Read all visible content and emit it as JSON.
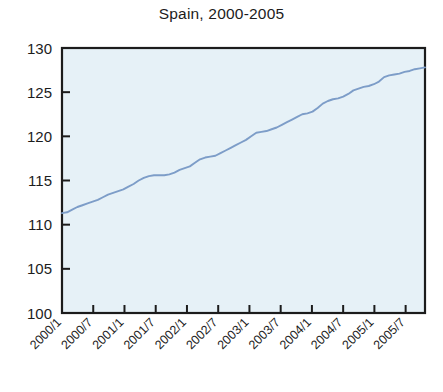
{
  "chart_data": {
    "type": "line",
    "title": "Spain, 2000-2005",
    "xlabel": "",
    "ylabel": "",
    "ylim": [
      100,
      130
    ],
    "yticks": [
      100,
      105,
      110,
      115,
      120,
      125,
      130
    ],
    "ytick_labels": [
      "100",
      "105",
      "110",
      "115",
      "120",
      "125",
      "130"
    ],
    "xtick_labels": [
      "2000/1",
      "2000/7",
      "2001/1",
      "2001/7",
      "2002/1",
      "2002/7",
      "2003/1",
      "2003/7",
      "2004/1",
      "2004/7",
      "2005/1",
      "2005/7"
    ],
    "xtick_label_rotation": -45,
    "grid": false,
    "legend": null,
    "plot_background_color": "#e6f1f7",
    "line_color": "#7d9dc8",
    "frame_color": "#1c1c1c",
    "x": [
      "2000/1",
      "2000/2",
      "2000/3",
      "2000/4",
      "2000/5",
      "2000/6",
      "2000/7",
      "2000/8",
      "2000/9",
      "2000/10",
      "2000/11",
      "2000/12",
      "2001/1",
      "2001/2",
      "2001/3",
      "2001/4",
      "2001/5",
      "2001/6",
      "2001/7",
      "2001/8",
      "2001/9",
      "2001/10",
      "2001/11",
      "2001/12",
      "2002/1",
      "2002/2",
      "2002/3",
      "2002/4",
      "2002/5",
      "2002/6",
      "2002/7",
      "2002/8",
      "2002/9",
      "2002/10",
      "2002/11",
      "2002/12",
      "2003/1",
      "2003/2",
      "2003/3",
      "2003/4",
      "2003/5",
      "2003/6",
      "2003/7",
      "2003/8",
      "2003/9",
      "2003/10",
      "2003/11",
      "2003/12",
      "2004/1",
      "2004/2",
      "2004/3",
      "2004/4",
      "2004/5",
      "2004/6",
      "2004/7",
      "2004/8",
      "2004/9",
      "2004/10",
      "2004/11",
      "2004/12",
      "2005/1",
      "2005/2",
      "2005/3",
      "2005/4",
      "2005/5",
      "2005/6",
      "2005/7",
      "2005/8",
      "2005/9",
      "2005/10",
      "2005/11",
      "2005/12"
    ],
    "values": [
      111.3,
      111.4,
      111.7,
      112.0,
      112.2,
      112.4,
      112.6,
      112.8,
      113.1,
      113.4,
      113.6,
      113.8,
      114.0,
      114.3,
      114.6,
      115.0,
      115.3,
      115.5,
      115.6,
      115.6,
      115.6,
      115.7,
      115.9,
      116.2,
      116.4,
      116.6,
      117.0,
      117.4,
      117.6,
      117.7,
      117.8,
      118.1,
      118.4,
      118.7,
      119.0,
      119.3,
      119.6,
      120.0,
      120.4,
      120.5,
      120.6,
      120.8,
      121.0,
      121.3,
      121.6,
      121.9,
      122.2,
      122.5,
      122.6,
      122.8,
      123.2,
      123.7,
      124.0,
      124.2,
      124.3,
      124.5,
      124.8,
      125.2,
      125.4,
      125.6,
      125.7,
      125.9,
      126.2,
      126.7,
      126.9,
      127.0,
      127.1,
      127.3,
      127.4,
      127.6,
      127.7,
      127.8
    ]
  }
}
